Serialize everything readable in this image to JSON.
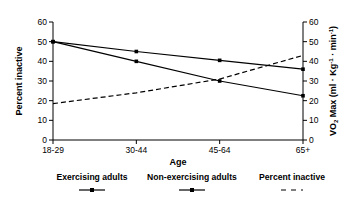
{
  "chart_data": {
    "type": "line",
    "title": "",
    "xlabel": "Age",
    "ylabel": "Percent inactive",
    "y2label": "VO2 Max (ml · Kg-1 · min-1)",
    "categories": [
      "18-29",
      "30-44",
      "45-64",
      "65+"
    ],
    "ylim": [
      0,
      60
    ],
    "y2lim": [
      0,
      60
    ],
    "yticks": [
      0,
      10,
      20,
      30,
      40,
      50,
      60
    ],
    "y2ticks": [
      0,
      10,
      20,
      30,
      40,
      50,
      60
    ],
    "grid": false,
    "legend_position": "bottom",
    "series": [
      {
        "name": "Exercising adults",
        "values": [
          50,
          45,
          40.5,
          36
        ],
        "axis": "right",
        "style": "solid",
        "marker": "square",
        "color": "#000000"
      },
      {
        "name": "Non-exercising adults",
        "values": [
          50,
          40,
          30,
          22.5
        ],
        "axis": "right",
        "style": "solid",
        "marker": "square",
        "color": "#000000"
      },
      {
        "name": "Percent inactive",
        "values": [
          18.5,
          24,
          31,
          43
        ],
        "axis": "left",
        "style": "dashed",
        "marker": "none",
        "color": "#000000"
      }
    ]
  },
  "axes": {
    "left": {
      "label": "Percent inactive",
      "ticks": [
        "0",
        "10",
        "20",
        "30",
        "40",
        "50",
        "60"
      ]
    },
    "right": {
      "label_parts": {
        "v": "V",
        "o": "O",
        "two": "2",
        "max": " Max  (ml · Kg",
        "neg1a": "-1",
        "middot": " · min",
        "neg1b": "-1",
        "close": ")"
      },
      "ticks": [
        "0",
        "10",
        "20",
        "30",
        "40",
        "50",
        "60"
      ]
    },
    "bottom": {
      "label": "Age",
      "ticks": [
        "18-29",
        "30-44",
        "45-64",
        "65+"
      ]
    }
  },
  "legend": {
    "items": [
      {
        "label": "Exercising adults",
        "style": "solid-marker"
      },
      {
        "label": "Non-exercising adults",
        "style": "solid-marker"
      },
      {
        "label": "Percent inactive",
        "style": "dashed"
      }
    ]
  },
  "colors": {
    "background": "#ffffff",
    "ink": "#000000"
  }
}
